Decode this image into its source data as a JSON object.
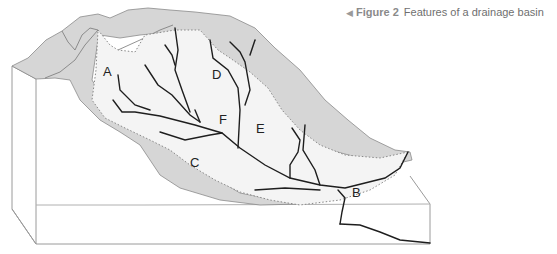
{
  "caption": {
    "arrow_icon": "◀",
    "figure_number": "Figure 2",
    "title": "Features of a drainage basin"
  },
  "labels": {
    "A": "A",
    "B": "B",
    "C": "C",
    "D": "D",
    "E": "E",
    "F": "F"
  },
  "colors": {
    "outer_slope": "#d6d6d6",
    "basin_fill": "#f4f4f4",
    "river": "#1e1e1e",
    "block_edge": "#9a9a9a",
    "watershed_dotted": "#888888"
  }
}
